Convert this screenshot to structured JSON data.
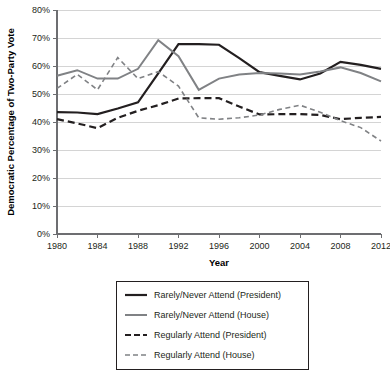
{
  "chart_data": {
    "type": "line",
    "title": "",
    "xlabel": "Year",
    "ylabel": "Democratic Percentage of Two-Party Vote",
    "xlim": [
      1980,
      2012
    ],
    "ylim": [
      0,
      80
    ],
    "grid": true,
    "legend_position": "below-plot",
    "x_tick_labels": [
      "1980",
      "1984",
      "1988",
      "1992",
      "1996",
      "2000",
      "2004",
      "2008",
      "2012"
    ],
    "x_ticks": [
      1980,
      1984,
      1988,
      1992,
      1996,
      2000,
      2004,
      2008,
      2012
    ],
    "y_tick_labels": [
      "0%",
      "10%",
      "20%",
      "30%",
      "40%",
      "50%",
      "60%",
      "70%",
      "80%"
    ],
    "y_ticks": [
      0,
      10,
      20,
      30,
      40,
      50,
      60,
      70,
      80
    ],
    "x": [
      1980,
      1982,
      1984,
      1986,
      1988,
      1990,
      1992,
      1994,
      1996,
      1998,
      2000,
      2002,
      2004,
      2006,
      2008,
      2010,
      2012
    ],
    "series": [
      {
        "name": "Rarely/Never Attend (President)",
        "color": "#231f20",
        "style": "solid",
        "width": 2.2,
        "values": [
          43.5,
          43.4,
          42.8,
          44.8,
          47.0,
          57.4,
          67.8,
          67.8,
          67.6,
          62.8,
          57.8,
          56.5,
          55.2,
          57.3,
          61.5,
          60.4,
          59.0
        ]
      },
      {
        "name": "Rarely/Never Attend (House)",
        "color": "#808285",
        "style": "solid",
        "width": 2.0,
        "values": [
          56.5,
          58.5,
          55.5,
          55.5,
          59.0,
          69.2,
          63.5,
          51.5,
          55.5,
          57.0,
          57.5,
          57.3,
          57.0,
          58.0,
          59.5,
          57.5,
          54.5
        ]
      },
      {
        "name": "Regularly Attend (President)",
        "color": "#231f20",
        "style": "dashed",
        "width": 2.2,
        "values": [
          41.0,
          39.5,
          37.8,
          41.5,
          44.0,
          46.0,
          48.4,
          48.5,
          48.5,
          45.5,
          42.7,
          42.8,
          42.8,
          42.5,
          41.0,
          41.5,
          41.8
        ]
      },
      {
        "name": "Regularly Attend (House)",
        "color": "#808285",
        "style": "dashed",
        "width": 1.6,
        "values": [
          52.0,
          57.0,
          51.5,
          63.0,
          55.5,
          58.0,
          52.8,
          41.5,
          41.0,
          41.5,
          42.5,
          44.5,
          46.0,
          43.5,
          40.5,
          38.0,
          33.2
        ]
      }
    ]
  },
  "legend": {
    "items": [
      {
        "label": "Rarely/Never Attend (President)",
        "color": "#231f20",
        "style": "solid"
      },
      {
        "label": "Rarely/Never Attend (House)",
        "color": "#808285",
        "style": "solid"
      },
      {
        "label": "Regularly Attend (President)",
        "color": "#231f20",
        "style": "dashed"
      },
      {
        "label": "Regularly Attend (House)",
        "color": "#808285",
        "style": "dashed"
      }
    ]
  }
}
